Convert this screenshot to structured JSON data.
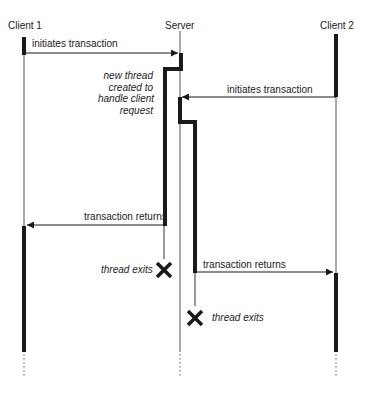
{
  "participants": {
    "client1": "Client 1",
    "server": "Server",
    "client2": "Client 2"
  },
  "messages": {
    "m1": "initiates transaction",
    "m2": "initiates transaction",
    "m3": "transaction returns",
    "m4": "transaction returns"
  },
  "annotations": {
    "new_thread_line1": "new thread",
    "new_thread_line2": "created to",
    "new_thread_line3": "handle client",
    "new_thread_line4": "request",
    "thread_exit_1": "thread exits",
    "thread_exit_2": "thread exits"
  },
  "colors": {
    "line": "#1a1a1a",
    "thin_line": "#555555",
    "background": "#ffffff"
  }
}
